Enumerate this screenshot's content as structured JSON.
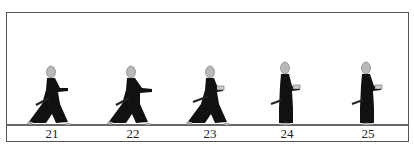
{
  "diagram": {
    "type": "sequence-illustration",
    "colors": {
      "frame": "#555555",
      "robe": "#111111",
      "head": "#b8b8b8",
      "ground": "#666666"
    },
    "figures": [
      {
        "step": "21",
        "pose": "wide-stance",
        "x": 16
      },
      {
        "step": "22",
        "pose": "wide-stance",
        "x": 96
      },
      {
        "step": "23",
        "pose": "wide-stance-hands-close",
        "x": 175
      },
      {
        "step": "24",
        "pose": "standing",
        "x": 250
      },
      {
        "step": "25",
        "pose": "standing",
        "x": 331
      }
    ]
  }
}
